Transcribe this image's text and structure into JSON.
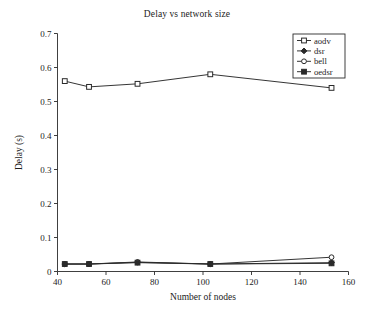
{
  "chart_data": {
    "type": "line",
    "title": "Delay vs network size",
    "xlabel": "Number of nodes",
    "ylabel": "Delay (s)",
    "xlim": [
      40,
      160
    ],
    "ylim": [
      0,
      0.7
    ],
    "xticks": [
      40,
      60,
      80,
      100,
      120,
      140,
      160
    ],
    "xtick_labels": [
      "40",
      "60",
      "80",
      "100",
      "120",
      "140",
      "160"
    ],
    "yticks": [
      0,
      0.1,
      0.2,
      0.3,
      0.4,
      0.5,
      0.6,
      0.7
    ],
    "ytick_labels": [
      "0",
      "0.1",
      "0.2",
      "0.3",
      "0.4",
      "0.5",
      "0.6",
      "0.7"
    ],
    "grid": false,
    "legend_position": "upper right",
    "x": [
      43,
      53,
      73,
      103,
      153
    ],
    "series": [
      {
        "name": "aodv",
        "marker": "open-square",
        "values": [
          0.56,
          0.543,
          0.552,
          0.58,
          0.54
        ]
      },
      {
        "name": "dsr",
        "marker": "diamond",
        "values": [
          0.022,
          0.022,
          0.027,
          0.022,
          0.026
        ]
      },
      {
        "name": "bell",
        "marker": "open-circle",
        "values": [
          0.022,
          0.022,
          0.028,
          0.022,
          0.042
        ]
      },
      {
        "name": "oedsr",
        "marker": "filled-square",
        "values": [
          0.022,
          0.022,
          0.026,
          0.022,
          0.024
        ]
      }
    ],
    "line_color": "#2a2a2a",
    "background_color": "#ffffff"
  },
  "legend": {
    "entries": [
      {
        "label": "aodv"
      },
      {
        "label": "dsr"
      },
      {
        "label": "bell"
      },
      {
        "label": "oedsr"
      }
    ]
  }
}
